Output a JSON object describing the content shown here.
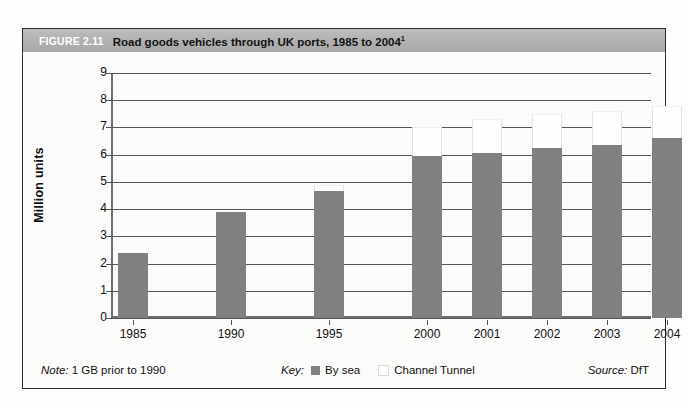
{
  "figure": {
    "number": "FIGURE 2.11",
    "title": "Road goods vehicles through UK ports, 1985 to 2004",
    "title_superscript": "1"
  },
  "footer": {
    "note_label": "Note:",
    "note_text": " 1 GB prior to 1990",
    "key_label": "Key:",
    "key_items": [
      {
        "label": "By sea",
        "color": "#808080"
      },
      {
        "label": "Channel Tunnel",
        "color": "#ffffff"
      }
    ],
    "source_label": "Source:",
    "source_text": " DfT"
  },
  "chart_data": {
    "type": "bar",
    "stacked": true,
    "title": "Road goods vehicles through UK ports, 1985 to 2004",
    "xlabel": "",
    "ylabel": "Million units",
    "categories": [
      "1985",
      "1990",
      "1995",
      "2000",
      "2001",
      "2002",
      "2003",
      "2004"
    ],
    "series": [
      {
        "name": "By sea",
        "color": "#808080",
        "values": [
          2.4,
          3.9,
          4.65,
          5.95,
          6.05,
          6.25,
          6.35,
          6.6
        ]
      },
      {
        "name": "Channel Tunnel",
        "color": "#ffffff",
        "values": [
          0,
          0,
          0.25,
          1.05,
          1.25,
          1.25,
          1.25,
          1.2
        ]
      }
    ],
    "totals": [
      2.4,
      3.9,
      4.9,
      7.0,
      7.3,
      7.5,
      7.6,
      7.8
    ],
    "ylim": [
      0,
      9
    ],
    "yticks": [
      "0",
      "1",
      "2",
      "3",
      "4",
      "5",
      "6",
      "7",
      "8",
      "9"
    ],
    "grid": true,
    "legend_position": "bottom-center"
  }
}
